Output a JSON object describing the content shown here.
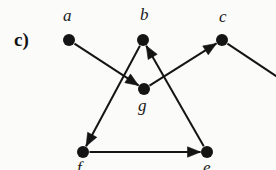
{
  "figure": {
    "width": 276,
    "height": 170,
    "background_color": "#fbfbf9",
    "ink_color": "#141414",
    "panel_label": "c)",
    "panel_label_x": 14,
    "panel_label_y": 30
  },
  "graph": {
    "type": "directed-graph",
    "node_radius": 6,
    "edge_width": 2,
    "nodes": [
      {
        "id": "a",
        "label": "a",
        "x": 69,
        "y": 40,
        "label_x": 63,
        "label_y": 7,
        "visible": true
      },
      {
        "id": "b",
        "label": "b",
        "x": 143,
        "y": 40,
        "label_x": 140,
        "label_y": 6,
        "visible": true
      },
      {
        "id": "c",
        "label": "c",
        "x": 222,
        "y": 40,
        "label_x": 219,
        "label_y": 8,
        "visible": true
      },
      {
        "id": "g",
        "label": "g",
        "x": 144,
        "y": 89,
        "label_x": 138,
        "label_y": 97,
        "visible": true
      },
      {
        "id": "f",
        "label": "f",
        "x": 83,
        "y": 152,
        "label_x": 77,
        "label_y": 159,
        "visible": true
      },
      {
        "id": "e",
        "label": "e",
        "x": 207,
        "y": 152,
        "label_x": 203,
        "label_y": 159,
        "visible": true
      }
    ],
    "edges": [
      {
        "id": "a-g",
        "from": "a",
        "to": "g",
        "arrow": true,
        "clipped": false
      },
      {
        "id": "b-f",
        "from": "b",
        "to": "f",
        "arrow": true,
        "clipped": false
      },
      {
        "id": "g-c",
        "from": "g",
        "to": "c",
        "arrow": true,
        "clipped": false
      },
      {
        "id": "e-b",
        "from": "e",
        "to": "b",
        "arrow": true,
        "clipped": false
      },
      {
        "id": "f-e",
        "from": "f",
        "to": "e",
        "arrow": true,
        "clipped": false
      },
      {
        "id": "c-out",
        "from": "c",
        "to": null,
        "arrow": false,
        "clipped": true,
        "end_x": 285,
        "end_y": 82
      }
    ]
  }
}
